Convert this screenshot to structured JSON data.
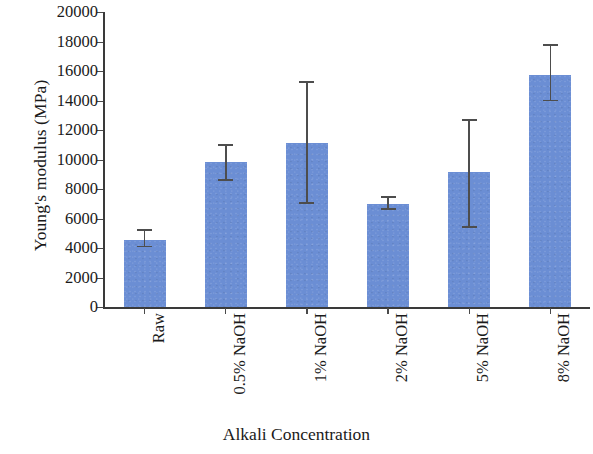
{
  "chart_data": {
    "type": "bar",
    "title": "",
    "xlabel": "Alkali Concentration",
    "ylabel": "Young's modulus (MPa)",
    "categories": [
      "Raw",
      "0.5% NaOH",
      "1% NaOH",
      "2% NaOH",
      "5% NaOH",
      "8% NaOH"
    ],
    "values": [
      4550,
      9850,
      11150,
      7000,
      9150,
      15750
    ],
    "errors_low": [
      4100,
      8600,
      7050,
      6650,
      5450,
      14000
    ],
    "errors_high": [
      5200,
      11000,
      15250,
      7450,
      12700,
      17750
    ],
    "ylim": [
      0,
      20000
    ],
    "ytick_labels": [
      "0",
      "2000",
      "4000",
      "6000",
      "8000",
      "10000",
      "12000",
      "14000",
      "16000",
      "18000",
      "20000"
    ],
    "ytick_values": [
      0,
      2000,
      4000,
      6000,
      8000,
      10000,
      12000,
      14000,
      16000,
      18000,
      20000
    ],
    "grid": false,
    "legend": "none",
    "series_color": "#6b8ed4",
    "axis_color": "#3a3a3a",
    "error_color": "#4d4d4d"
  }
}
